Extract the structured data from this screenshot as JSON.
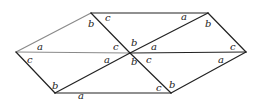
{
  "diagram": {
    "title": "",
    "vertices": {
      "L": [
        16,
        52
      ],
      "TL": [
        91,
        13
      ],
      "TR": [
        208,
        13
      ],
      "C": [
        130,
        53
      ],
      "R": [
        246,
        52
      ],
      "BL": [
        55,
        93
      ],
      "BR": [
        171,
        93
      ]
    },
    "edges": [
      {
        "from": "L",
        "to": "TL",
        "color": "#8a8a8a"
      },
      {
        "from": "L",
        "to": "C",
        "color": "#8a8a8a"
      },
      {
        "from": "L",
        "to": "BL",
        "color": "#222222"
      },
      {
        "from": "TL",
        "to": "TR",
        "color": "#222222"
      },
      {
        "from": "TL",
        "to": "C",
        "color": "#222222"
      },
      {
        "from": "C",
        "to": "TR",
        "color": "#222222"
      },
      {
        "from": "C",
        "to": "R",
        "color": "#222222"
      },
      {
        "from": "TR",
        "to": "R",
        "color": "#222222"
      },
      {
        "from": "BL",
        "to": "C",
        "color": "#222222"
      },
      {
        "from": "C",
        "to": "BR",
        "color": "#222222"
      },
      {
        "from": "BL",
        "to": "BR",
        "color": "#222222"
      },
      {
        "from": "BR",
        "to": "R",
        "color": "#222222"
      }
    ],
    "labels": [
      {
        "text": "b",
        "x": 88,
        "y": 27
      },
      {
        "text": "c",
        "x": 105,
        "y": 21
      },
      {
        "text": "a",
        "x": 37,
        "y": 50
      },
      {
        "text": "c",
        "x": 113,
        "y": 50
      },
      {
        "text": "c",
        "x": 27,
        "y": 63
      },
      {
        "text": "a",
        "x": 104,
        "y": 63
      },
      {
        "text": "b",
        "x": 52,
        "y": 89
      },
      {
        "text": "a",
        "x": 78,
        "y": 99
      },
      {
        "text": "b",
        "x": 131,
        "y": 46
      },
      {
        "text": "b",
        "x": 131,
        "y": 65
      },
      {
        "text": "a",
        "x": 151,
        "y": 50
      },
      {
        "text": "c",
        "x": 146,
        "y": 63
      },
      {
        "text": "a",
        "x": 181,
        "y": 20
      },
      {
        "text": "b",
        "x": 205,
        "y": 27
      },
      {
        "text": "c",
        "x": 230,
        "y": 50
      },
      {
        "text": "a",
        "x": 218,
        "y": 63
      },
      {
        "text": "c",
        "x": 156,
        "y": 91
      },
      {
        "text": "b",
        "x": 169,
        "y": 88
      }
    ]
  }
}
